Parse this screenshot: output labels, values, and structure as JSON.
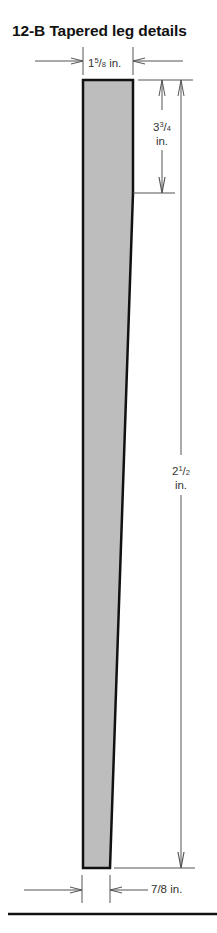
{
  "title": "12-B Tapered leg details",
  "figure": {
    "subject": "Tapered leg",
    "colors": {
      "leg_fill": "#bdbdbd",
      "outline": "#111111",
      "dim_line": "#555555"
    },
    "dimensions": {
      "top_width": {
        "whole": "1",
        "num": "5",
        "den": "8",
        "unit": "in.",
        "label": "1 5/8 in."
      },
      "straight_section": {
        "whole": "3",
        "num": "3",
        "den": "4",
        "unit": "in.",
        "label": "3 3/4 in."
      },
      "overall_length": {
        "whole": "2",
        "num": "1",
        "den": "2",
        "unit": "in.",
        "label": "2 1/2 in."
      },
      "bottom_width": {
        "label": "7/8 in."
      }
    }
  }
}
